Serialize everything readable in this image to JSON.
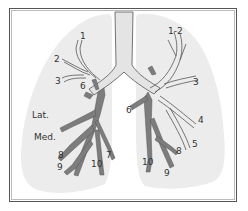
{
  "colors": {
    "lung_fill": "#ececec",
    "airway_light": "#e4e4e4",
    "airway_dark": "#7d7d7d",
    "outline": "#555555",
    "label": "#333333"
  },
  "right_lung": {
    "labels": {
      "s1": "1",
      "s2": "2",
      "s3": "3",
      "s6": "6",
      "lat": "Lat.",
      "med": "Med.",
      "s7": "7",
      "s8": "8",
      "s9": "9",
      "s10": "10"
    }
  },
  "left_lung": {
    "labels": {
      "s12": "1-2",
      "s3": "3",
      "s4": "4",
      "s5": "5",
      "s6": "6",
      "s8": "8",
      "s9": "9",
      "s10": "10"
    }
  }
}
